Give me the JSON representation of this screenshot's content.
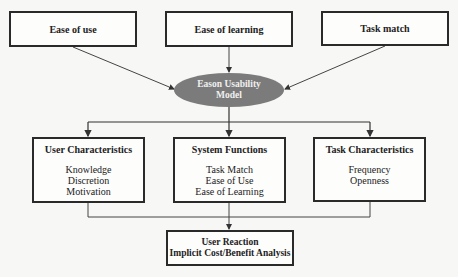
{
  "diagram": {
    "inputs": [
      {
        "label": "Ease of use"
      },
      {
        "label": "Ease of learning"
      },
      {
        "label": "Task match"
      }
    ],
    "center": {
      "line1": "Eason Usability",
      "line2": "Model"
    },
    "factors": [
      {
        "title": "User Characteristics",
        "items": [
          "Knowledge",
          "Discretion",
          "Motivation"
        ]
      },
      {
        "title": "System Functions",
        "items": [
          "Task Match",
          "Ease of Use",
          "Ease of Learning"
        ]
      },
      {
        "title": "Task Characteristics",
        "items": [
          "Frequency",
          "Openness"
        ]
      }
    ],
    "output": {
      "line1": "User Reaction",
      "line2": "Implicit Cost/Benefit Analysis"
    },
    "colors": {
      "ellipse_fill": "#7b7b7b",
      "border": "#2a2a2a",
      "background": "#f7f7f5"
    }
  }
}
